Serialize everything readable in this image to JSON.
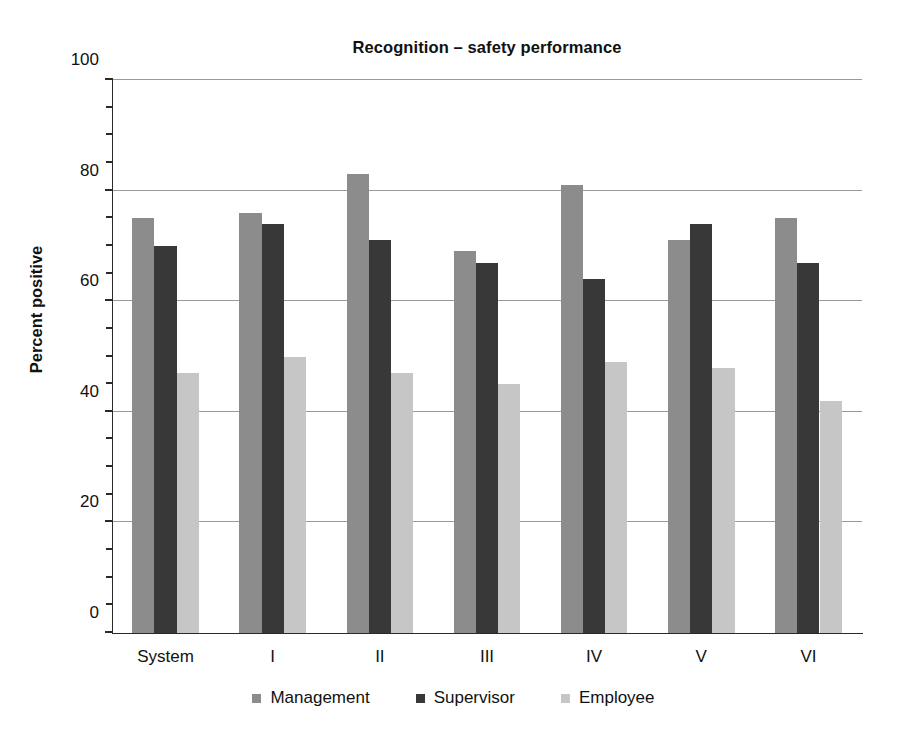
{
  "chart_data": {
    "type": "bar",
    "title": "Recognition – safety performance",
    "xlabel": "",
    "ylabel": "Percent positive",
    "ylim": [
      0,
      100
    ],
    "ytick_labels": [
      "0",
      "20",
      "40",
      "60",
      "80",
      "100"
    ],
    "ytick_values": [
      0,
      20,
      40,
      60,
      80,
      100
    ],
    "yminor_step": 5,
    "grid": "horizontal",
    "legend_position": "bottom",
    "categories": [
      "System",
      "I",
      "II",
      "III",
      "IV",
      "V",
      "VI"
    ],
    "series": [
      {
        "name": "Management",
        "color": "#8c8c8c",
        "values": [
          75,
          76,
          83,
          69,
          81,
          71,
          75
        ]
      },
      {
        "name": "Supervisor",
        "color": "#383838",
        "values": [
          70,
          74,
          71,
          67,
          64,
          74,
          67
        ]
      },
      {
        "name": "Employee",
        "color": "#c6c6c6",
        "values": [
          47,
          50,
          47,
          45,
          49,
          48,
          42
        ]
      }
    ]
  },
  "legend": {
    "items": [
      {
        "label": "Management",
        "color": "#8c8c8c"
      },
      {
        "label": "Supervisor",
        "color": "#383838"
      },
      {
        "label": "Employee",
        "color": "#c6c6c6"
      }
    ]
  }
}
